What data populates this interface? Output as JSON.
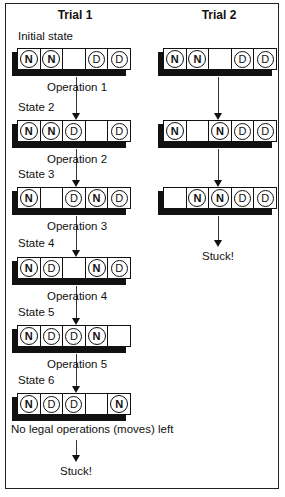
{
  "trials": [
    {
      "title": "Trial 1",
      "states": [
        {
          "label": "Initial state",
          "cells": [
            "N",
            "N",
            "",
            "D",
            "D"
          ]
        },
        {
          "label": "State 2",
          "cells": [
            "N",
            "N",
            "D",
            "",
            "D"
          ]
        },
        {
          "label": "State 3",
          "cells": [
            "N",
            "",
            "D",
            "N",
            "D"
          ]
        },
        {
          "label": "State 4",
          "cells": [
            "N",
            "D",
            "",
            "N",
            "D"
          ]
        },
        {
          "label": "State 5",
          "cells": [
            "N",
            "D",
            "D",
            "N",
            ""
          ]
        },
        {
          "label": "State 6",
          "cells": [
            "N",
            "D",
            "D",
            "",
            "N"
          ]
        }
      ],
      "operations": [
        "Operation 1",
        "Operation 2",
        "Operation 3",
        "Operation 4",
        "Operation 5"
      ],
      "final_note": "No legal operations (moves) left",
      "result": "Stuck!"
    },
    {
      "title": "Trial 2",
      "states": [
        {
          "label": "",
          "cells": [
            "N",
            "N",
            "",
            "D",
            "D"
          ]
        },
        {
          "label": "",
          "cells": [
            "N",
            "",
            "N",
            "D",
            "D"
          ]
        },
        {
          "label": "",
          "cells": [
            "",
            "N",
            "N",
            "D",
            "D"
          ]
        }
      ],
      "result": "Stuck!"
    }
  ],
  "token_legend": {
    "N": "N",
    "D": "D"
  }
}
